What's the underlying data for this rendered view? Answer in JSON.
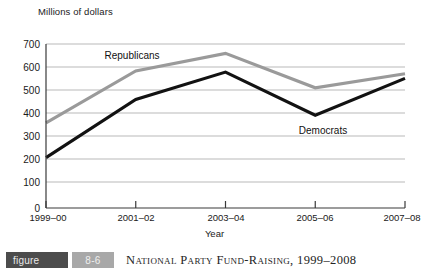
{
  "chart_data": {
    "type": "line",
    "title": "National Party Fund-Raising, 1999–2008",
    "xlabel": "Year",
    "ylabel": "Millions of dollars",
    "categories": [
      "1999–00",
      "2001–02",
      "2003–04",
      "2005–06",
      "2007–08"
    ],
    "ylim": [
      0,
      700
    ],
    "yticks": [
      0,
      100,
      200,
      300,
      400,
      500,
      600,
      700
    ],
    "grid": true,
    "legend_position": "inline-labels",
    "series": [
      {
        "name": "Republicans",
        "color": "#9a9a9a",
        "values": [
          363,
          585,
          660,
          513,
          573
        ]
      },
      {
        "name": "Democrats",
        "color": "#121212",
        "values": [
          215,
          463,
          580,
          396,
          553
        ]
      }
    ],
    "annotations": [
      {
        "text": "Republicans",
        "series": "Republicans"
      },
      {
        "text": "Democrats",
        "series": "Democrats"
      }
    ]
  },
  "axis": {
    "y_title": "Millions of dollars",
    "x_title": "Year",
    "y_ticks": [
      "700",
      "600",
      "500",
      "400",
      "300",
      "200",
      "100",
      "0"
    ],
    "x_ticks": [
      "1999–00",
      "2001–02",
      "2003–04",
      "2005–06",
      "2007–08"
    ]
  },
  "labels": {
    "republicans": "Republicans",
    "democrats": "Democrats"
  },
  "caption": {
    "tag": "figure",
    "number": "8-6",
    "text": "National Party Fund-Raising, 1999–2008"
  },
  "colors": {
    "republicans_line": "#9a9a9a",
    "democrats_line": "#121212",
    "gridline": "#b9b9b9",
    "axis": "#3a3a3a",
    "tag_bg": "#4c4c4c",
    "number_bg": "#a8a8a8"
  }
}
